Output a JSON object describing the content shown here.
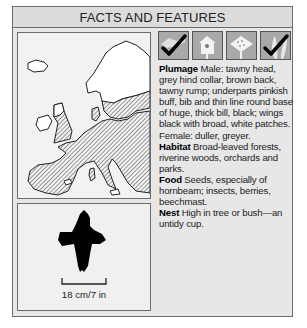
{
  "header": {
    "title": "FACTS AND FEATURES"
  },
  "map": {
    "description": "distribution-map-europe",
    "range_fill": "hatched"
  },
  "icons": [
    {
      "name": "open-country-icon",
      "checked": true
    },
    {
      "name": "nestbox-icon",
      "checked": false
    },
    {
      "name": "bird-table-icon",
      "checked": false
    },
    {
      "name": "garden-icon",
      "checked": true
    }
  ],
  "facts": {
    "plumage": {
      "label": "Plumage",
      "text": " Male: tawny head, grey hind collar, brown back, tawny rump; underparts pinkish buff, bib and thin line round base of huge, thick bill, black; wings black with broad, white patches. Female: duller, greyer."
    },
    "habitat": {
      "label": "Habitat",
      "text": " Broad-leaved forests, riverine woods, orchards and parks."
    },
    "food": {
      "label": "Food",
      "text": " Seeds, especially of hornbeam; insects, berries, beechmast."
    },
    "nest": {
      "label": "Nest",
      "text": " High in tree or bush—an untidy cup."
    }
  },
  "silhouette": {
    "scale_label": "18 cm/7 in"
  },
  "colors": {
    "frame_bg": "#e7e7e7",
    "border": "#6d6d6d",
    "icon_bg": "#a9a9a9"
  }
}
